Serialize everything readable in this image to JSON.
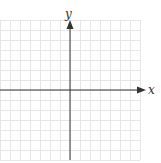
{
  "diagram": {
    "type": "coordinate-plane",
    "x_axis_label": "x",
    "y_axis_label": "y",
    "grid": {
      "columns": 14,
      "rows": 14,
      "left": 0,
      "top": 20,
      "width": 140,
      "height": 140,
      "line_color": "#e6e6e6"
    },
    "axis_color": "#333333",
    "origin": {
      "x": 70,
      "y": 90
    }
  }
}
